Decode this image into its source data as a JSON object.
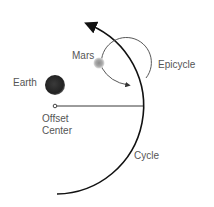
{
  "diagram": {
    "labels": {
      "earth": "Earth",
      "mars": "Mars",
      "epicycle": "Epicycle",
      "offset_center_line1": "Offset",
      "offset_center_line2": "Center",
      "cycle": "Cycle"
    },
    "colors": {
      "line": "#111111",
      "epicycle_line": "#444444",
      "earth": "#2a2a2a",
      "mars": "#9a9a9a",
      "text": "#555555"
    }
  }
}
